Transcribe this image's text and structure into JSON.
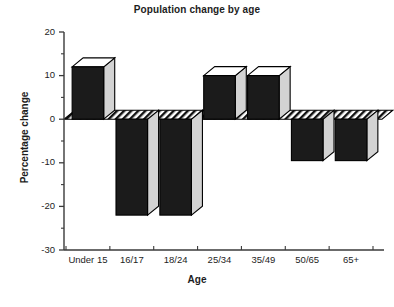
{
  "chart_data": {
    "type": "bar",
    "title": "Population change by age",
    "xlabel": "Age",
    "ylabel": "Percentage change",
    "categories": [
      "Under 15",
      "16/17",
      "18/24",
      "25/34",
      "35/49",
      "50/65",
      "65+"
    ],
    "values": [
      12,
      -22,
      -22,
      10,
      10,
      -9.5,
      -9.5
    ],
    "ylim": [
      -30,
      20
    ],
    "ytick_labels": [
      "20",
      "10",
      "0",
      "-10",
      "-20",
      "-30"
    ],
    "ytick_values": [
      20,
      10,
      0,
      -10,
      -20,
      -30
    ],
    "minor_tick_step": 5,
    "grid": false,
    "legend": false,
    "style": "3d-block-bars",
    "colors": {
      "bar_front": "#1b1b1b",
      "bar_top": "#ffffff",
      "bar_side": "#d3d3d3",
      "axis": "#3a3a3a",
      "background": "#ffffff"
    }
  },
  "axes": {
    "y_title": "Percentage change",
    "x_title": "Age"
  },
  "title": {
    "text": "Population change by age"
  }
}
